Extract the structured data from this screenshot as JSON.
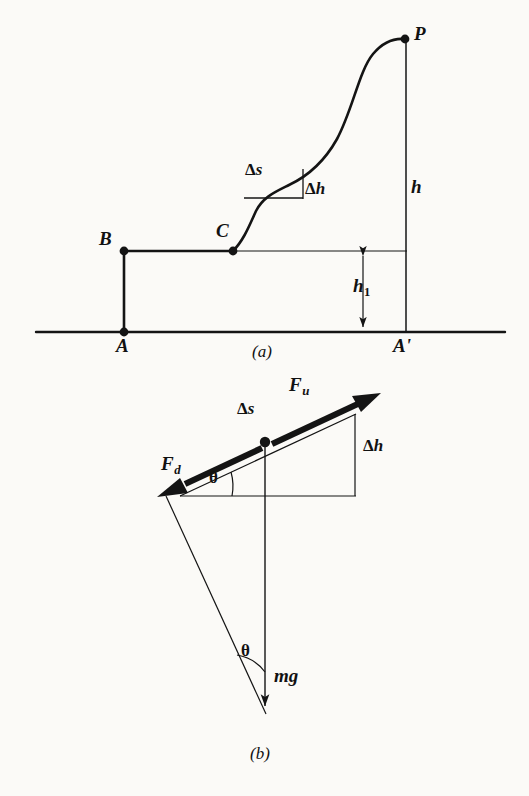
{
  "figure": {
    "panels": [
      {
        "id": "a",
        "caption": "(a)",
        "description": "Path A-B-C-P above a ground reference line with height h, h1 and a small step of Ds and Dh on the curve"
      },
      {
        "id": "b",
        "caption": "(b)",
        "description": "Force triangle showing F_u up-slope, F_d down-slope, weight mg, slope angle theta, with Ds along slope and Dh rise"
      }
    ]
  },
  "panel_a": {
    "points": [
      {
        "name": "A",
        "label": "A",
        "x": 124,
        "y": 332
      },
      {
        "name": "B",
        "label": "B",
        "x": 124,
        "y": 251
      },
      {
        "name": "C",
        "label": "C",
        "x": 233,
        "y": 251
      },
      {
        "name": "P",
        "label": "P",
        "x": 405,
        "y": 39
      },
      {
        "name": "A'",
        "label": "A'",
        "x": 405,
        "y": 332
      }
    ],
    "labels": {
      "A": {
        "text": "A",
        "x": 117,
        "y": 338
      },
      "B": {
        "text": "B",
        "x": 100,
        "y": 231
      },
      "C": {
        "text": "C",
        "x": 218,
        "y": 224
      },
      "P": {
        "text": "P",
        "x": 414,
        "y": 26
      },
      "Aprime": {
        "text": "A'",
        "x": 396,
        "y": 338
      },
      "h": {
        "text": "h",
        "x": 411,
        "y": 178
      },
      "h1": {
        "text": "h",
        "sub": "1",
        "x": 355,
        "y": 279
      },
      "delta_s": {
        "delta": "Δ",
        "var": "s",
        "x": 247,
        "y": 163
      },
      "delta_h": {
        "delta": "Δ",
        "var": "h",
        "x": 305,
        "y": 183
      },
      "caption": {
        "text": "(a)",
        "x": 254,
        "y": 345
      }
    },
    "ground_line": {
      "x1": 36,
      "x2": 505,
      "y": 332
    },
    "level_line": {
      "x1": 233,
      "x2": 406,
      "y": 251
    },
    "vertical_h": {
      "x": 406,
      "y1": 39,
      "y2": 332
    },
    "vertical_AB": {
      "x": 124,
      "y1": 251,
      "y2": 332
    },
    "segment_BC": {
      "x1": 124,
      "x2": 233,
      "y": 251
    },
    "h1_arrow": {
      "x": 363,
      "y1": 251,
      "y2": 332
    },
    "step": {
      "horizontal": {
        "x1": 244,
        "x2": 303,
        "y": 198
      },
      "vertical": {
        "x": 303,
        "y1": 170,
        "y2": 198
      }
    },
    "curve_path": "M 233 251 C 243 238 249 222 255 210 C 262 197 274 192 288 185 C 305 177 322 165 336 140 C 352 110 358 72 372 54 C 382 42 394 38 405 39"
  },
  "panel_b": {
    "labels": {
      "F_u": {
        "text": "F",
        "sub": "u",
        "x": 291,
        "y": 378
      },
      "F_d": {
        "text": "F",
        "sub": "d",
        "x": 163,
        "y": 457
      },
      "delta_s": {
        "delta": "Δ",
        "var": "s",
        "x": 239,
        "y": 403
      },
      "delta_h": {
        "delta": "Δ",
        "var": "h",
        "x": 363,
        "y": 440
      },
      "theta_slope": {
        "text": "θ",
        "x": 211,
        "y": 472
      },
      "theta_bottom": {
        "text": "θ",
        "x": 243,
        "y": 645
      },
      "mg": {
        "text": "mg",
        "x": 276,
        "y": 669
      },
      "caption": {
        "text": "(b)",
        "x": 252,
        "y": 748
      }
    },
    "geometry": {
      "slope_vertex": {
        "x": 180,
        "y": 496
      },
      "slope_right": {
        "x": 355,
        "y": 415
      },
      "baseline_y": 496,
      "baseline_x1": 180,
      "baseline_x2": 355,
      "dh_x": 355,
      "dot": {
        "x": 265,
        "y": 442
      },
      "fu_tip": {
        "x": 380,
        "y": 394
      },
      "fu_tail": {
        "x": 270,
        "y": 446
      },
      "fd_tip": {
        "x": 157,
        "y": 497
      },
      "fd_tail": {
        "x": 262,
        "y": 446
      },
      "mg_top": {
        "x": 265,
        "y": 440
      },
      "mg_tip": {
        "x": 265,
        "y": 716
      },
      "hyp_from": {
        "x": 166,
        "y": 496
      },
      "hyp_to": {
        "x": 265,
        "y": 714
      }
    }
  },
  "style": {
    "ink": "#141414",
    "paper": "#fbfaf7",
    "thick_stroke": 2.6,
    "thin_stroke": 1.2,
    "vector_stroke": 6
  }
}
